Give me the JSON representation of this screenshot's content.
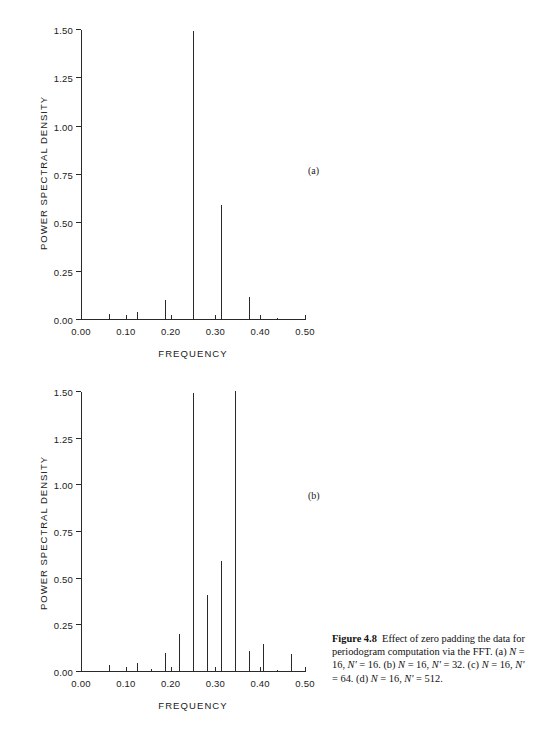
{
  "figure": {
    "label": "Figure 4.8",
    "caption_text": "Effect of zero padding the data for periodogram computation via the FFT. (a) N = 16, N' = 16. (b) N = 16, N' = 32. (c) N = 16, N' = 64. (d) N = 16, N' = 512.",
    "caption_parts": {
      "lead": "Figure 4.8",
      "t1": "Effect of zero padding the data for periodogram computation via the FFT. (a) ",
      "n1": "N",
      "t2": " = 16, ",
      "n2": "N'",
      "t3": " = 16. (b) ",
      "n3": "N",
      "t4": " = 16, ",
      "n4": "N'",
      "t5": " = 32. (c) ",
      "n5": "N",
      "t6": " = 16, ",
      "n6": "N'",
      "t7": " = 64. (d) ",
      "n7": "N",
      "t8": " = 16, ",
      "n8": "N'",
      "t9": " = 512."
    }
  },
  "panels": {
    "a": {
      "tag": "(a)"
    },
    "b": {
      "tag": "(b)"
    }
  },
  "chart_data": [
    {
      "id": "a",
      "type": "bar",
      "title": "",
      "panel_label": "(a)",
      "xlabel": "FREQUENCY",
      "ylabel": "POWER SPECTRAL DENSITY",
      "xlim": [
        0.0,
        0.5
      ],
      "ylim": [
        0.0,
        1.5
      ],
      "xticks": [
        0.0,
        0.1,
        0.2,
        0.3,
        0.4,
        0.5
      ],
      "xticklabels": [
        "0.00",
        "0.10",
        "0.20",
        "0.30",
        "0.40",
        "0.50"
      ],
      "yticks": [
        0.0,
        0.25,
        0.5,
        0.75,
        1.0,
        1.25,
        1.5
      ],
      "yticklabels": [
        "0.00",
        "0.25",
        "0.50",
        "0.75",
        "1.00",
        "1.25",
        "1.50"
      ],
      "grid": false,
      "legend": null,
      "x": [
        0.0,
        0.0625,
        0.125,
        0.1875,
        0.25,
        0.3125,
        0.375,
        0.4375
      ],
      "values": [
        0.005,
        0.03,
        0.043,
        0.102,
        1.495,
        0.595,
        0.118,
        0.01
      ]
    },
    {
      "id": "b",
      "type": "bar",
      "title": "",
      "panel_label": "(b)",
      "xlabel": "FREQUENCY",
      "ylabel": "POWER SPECTRAL DENSITY",
      "xlim": [
        0.0,
        0.5
      ],
      "ylim": [
        0.0,
        1.5
      ],
      "xticks": [
        0.0,
        0.1,
        0.2,
        0.3,
        0.4,
        0.5
      ],
      "xticklabels": [
        "0.00",
        "0.10",
        "0.20",
        "0.30",
        "0.40",
        "0.50"
      ],
      "yticks": [
        0.0,
        0.25,
        0.5,
        0.75,
        1.0,
        1.25,
        1.5
      ],
      "yticklabels": [
        "0.00",
        "0.25",
        "0.50",
        "0.75",
        "1.00",
        "1.25",
        "1.50"
      ],
      "grid": false,
      "legend": null,
      "x": [
        0.0,
        0.0313,
        0.0625,
        0.0938,
        0.125,
        0.1563,
        0.1875,
        0.2188,
        0.25,
        0.2813,
        0.3125,
        0.3438,
        0.375,
        0.4063,
        0.4375,
        0.4688
      ],
      "values": [
        0.008,
        0.004,
        0.035,
        0.007,
        0.046,
        0.018,
        0.1,
        0.205,
        1.495,
        0.415,
        0.595,
        1.505,
        0.112,
        0.152,
        0.012,
        0.095
      ]
    }
  ]
}
